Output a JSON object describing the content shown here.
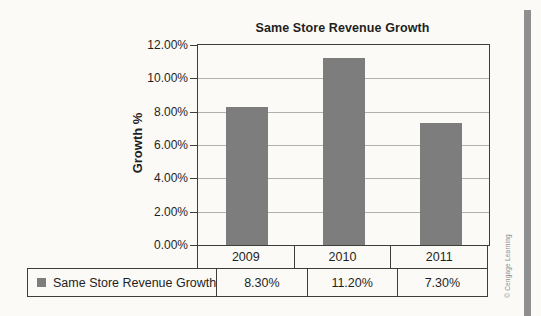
{
  "chart_data": {
    "type": "bar",
    "title": "Same Store Revenue Growth",
    "ylabel": "Growth %",
    "xlabel": "",
    "categories": [
      "2009",
      "2010",
      "2011"
    ],
    "series": [
      {
        "name": "Same Store Revenue Growth",
        "values": [
          8.3,
          11.2,
          7.3
        ],
        "value_labels": [
          "8.30%",
          "11.20%",
          "7.30%"
        ]
      }
    ],
    "ylim": [
      0,
      12
    ],
    "y_tick_step": 2,
    "y_tick_labels": [
      "0.00%",
      "2.00%",
      "4.00%",
      "6.00%",
      "8.00%",
      "10.00%",
      "12.00%"
    ],
    "grid": true,
    "legend_position": "bottom-table",
    "bar_color": "#7d7d7d"
  },
  "colors": {
    "paper": "#fbfaf6",
    "bar_fill": "#7d7d7d",
    "grid_line": "#b0b0b0",
    "axis_line": "#3d3d3d",
    "text": "#1f1f1f",
    "copyright_text": "#8a8a8a",
    "page_edge_strip": "#8f8f8f"
  },
  "footer": {
    "copyright": "© Cengage Learning"
  }
}
